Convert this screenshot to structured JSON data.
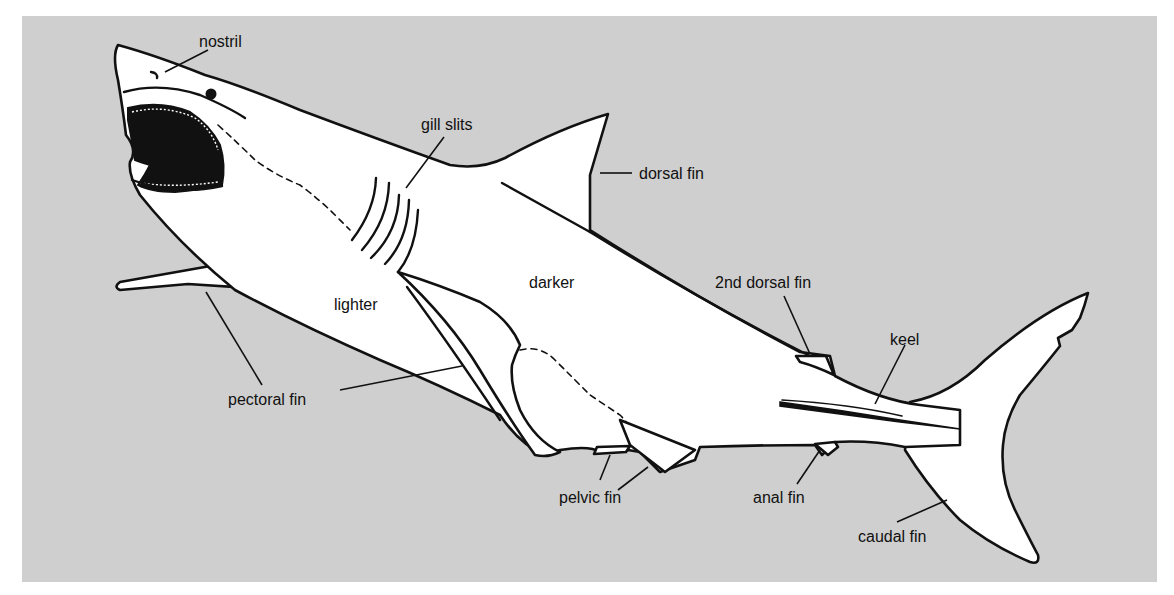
{
  "diagram": {
    "colors": {
      "background": "#cfcfcf",
      "body": "#ffffff",
      "ink": "#111111"
    },
    "labels": {
      "nostril": "nostril",
      "gill_slits": "gill slits",
      "dorsal_fin": "dorsal fin",
      "darker": "darker",
      "lighter": "lighter",
      "second_dorsal_fin": "2nd dorsal fin",
      "keel": "keel",
      "pectoral_fin": "pectoral fin",
      "pelvic_fin": "pelvic fin",
      "anal_fin": "anal fin",
      "caudal_fin": "caudal fin"
    }
  }
}
